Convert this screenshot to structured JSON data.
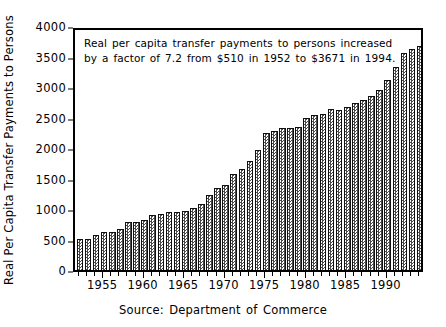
{
  "chart_data": {
    "type": "bar",
    "title": "",
    "subtitle": "",
    "xlabel": "",
    "ylabel": "Real Per Capita Transfer Payments to Persons",
    "source": "Source: Department of Commerce",
    "annotation_lines": [
      "Real per capita transfer payments to persons increased",
      "by a factor of 7.2 from $510 in 1952 to $3671 in 1994."
    ],
    "ylim": [
      0,
      4000
    ],
    "xlim": [
      1951.4,
      1994.6
    ],
    "grid": false,
    "legend": null,
    "ytick_labels": [
      "0",
      "500",
      "1000",
      "1500",
      "2000",
      "2500",
      "3000",
      "3500",
      "4000"
    ],
    "yticks": [
      0,
      500,
      1000,
      1500,
      2000,
      2500,
      3000,
      3500,
      4000
    ],
    "xtick_labels": [
      "1955",
      "1960",
      "1965",
      "1970",
      "1975",
      "1980",
      "1985",
      "1990"
    ],
    "xticks": [
      1955,
      1960,
      1965,
      1970,
      1975,
      1980,
      1985,
      1990
    ],
    "x_minor_tick_step": 1,
    "categories": [
      1952,
      1953,
      1954,
      1955,
      1956,
      1957,
      1958,
      1959,
      1960,
      1961,
      1962,
      1963,
      1964,
      1965,
      1966,
      1967,
      1968,
      1969,
      1970,
      1971,
      1972,
      1973,
      1974,
      1975,
      1976,
      1977,
      1978,
      1979,
      1980,
      1981,
      1982,
      1983,
      1984,
      1985,
      1986,
      1987,
      1988,
      1989,
      1990,
      1991,
      1992,
      1993,
      1994
    ],
    "values": [
      510,
      505,
      570,
      625,
      625,
      680,
      790,
      785,
      815,
      910,
      925,
      945,
      950,
      960,
      1010,
      1080,
      1235,
      1340,
      1400,
      1570,
      1660,
      1790,
      1975,
      2245,
      2280,
      2330,
      2320,
      2350,
      2500,
      2540,
      2550,
      2635,
      2620,
      2680,
      2740,
      2785,
      2845,
      2955,
      3110,
      3330,
      3560,
      3620,
      3671
    ],
    "colors": {
      "bar_fill_pattern": "#4a4a4a",
      "bar_background": "#ffffff",
      "bar_edge": "#111111",
      "axis": "#000000",
      "text": "#000000",
      "plot_background": "#ffffff"
    }
  }
}
